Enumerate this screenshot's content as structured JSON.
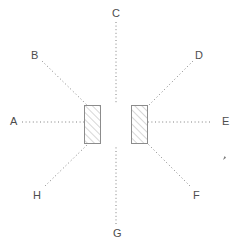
{
  "figure": {
    "background_color": "#ffffff",
    "line_color": "#808080",
    "label_color": "#4d4d4d",
    "hatch_color": "#a6a6a6",
    "barrier_stroke_color": "#8c8c8c",
    "barrier_fill_color": "#ffffff"
  },
  "aperture": {
    "center": {
      "x": 116,
      "y": 124
    },
    "gap_width": 30,
    "barriers": [
      {
        "name": "left-barrier",
        "x": 84,
        "y": 105,
        "width": 16,
        "height": 38,
        "hatch": "diagonal-up-right"
      },
      {
        "name": "right-barrier",
        "x": 131,
        "y": 105,
        "width": 16,
        "height": 38,
        "hatch": "diagonal-up-right"
      }
    ]
  },
  "rays": [
    {
      "id": "A",
      "label": "A",
      "direction": "west",
      "angle_deg": 180,
      "start": {
        "x": 22,
        "y": 122
      },
      "end": {
        "x": 84,
        "y": 122
      },
      "label_pos": {
        "x": 10,
        "y": 116
      }
    },
    {
      "id": "B",
      "label": "B",
      "direction": "northwest",
      "angle_deg": 135,
      "start": {
        "x": 42,
        "y": 61
      },
      "end": {
        "x": 88,
        "y": 106
      },
      "label_pos": {
        "x": 31,
        "y": 50
      }
    },
    {
      "id": "C",
      "label": "C",
      "direction": "north",
      "angle_deg": 90,
      "start": {
        "x": 116,
        "y": 22
      },
      "end": {
        "x": 116,
        "y": 104
      },
      "label_pos": {
        "x": 112,
        "y": 8
      }
    },
    {
      "id": "D",
      "label": "D",
      "direction": "northeast",
      "angle_deg": 45,
      "start": {
        "x": 193,
        "y": 61
      },
      "end": {
        "x": 148,
        "y": 106
      },
      "label_pos": {
        "x": 195,
        "y": 50
      }
    },
    {
      "id": "E",
      "label": "E",
      "direction": "east",
      "angle_deg": 0,
      "start": {
        "x": 210,
        "y": 122
      },
      "end": {
        "x": 148,
        "y": 122
      },
      "label_pos": {
        "x": 222,
        "y": 116
      }
    },
    {
      "id": "F",
      "label": "F",
      "direction": "southeast",
      "angle_deg": -45,
      "start": {
        "x": 190,
        "y": 186
      },
      "end": {
        "x": 148,
        "y": 144
      },
      "label_pos": {
        "x": 193,
        "y": 190
      }
    },
    {
      "id": "G",
      "label": "G",
      "direction": "south",
      "angle_deg": -90,
      "start": {
        "x": 116,
        "y": 224
      },
      "end": {
        "x": 116,
        "y": 146
      },
      "label_pos": {
        "x": 113,
        "y": 228
      }
    },
    {
      "id": "H",
      "label": "H",
      "direction": "southwest",
      "angle_deg": -135,
      "start": {
        "x": 45,
        "y": 186
      },
      "end": {
        "x": 88,
        "y": 144
      },
      "label_pos": {
        "x": 33,
        "y": 190
      }
    }
  ],
  "artifact": {
    "name": "stray-mark",
    "x": 223,
    "y": 156,
    "width": 3,
    "height": 4
  }
}
